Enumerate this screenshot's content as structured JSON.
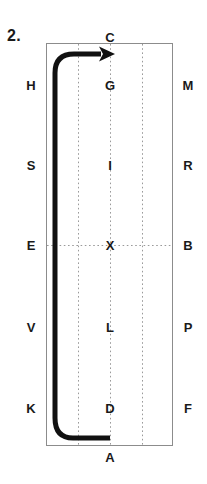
{
  "figure": {
    "index_label": "2.",
    "caption": "",
    "colors": {
      "rect_stroke": "#8c8c8c",
      "dotted": "#9a9a9a",
      "path": "#111111",
      "text": "#1a1a1a",
      "background": "#ffffff"
    },
    "rectangle": {
      "x": 46,
      "y": 43,
      "width": 126,
      "height": 402,
      "stroke_width": 1
    },
    "grid": {
      "vertical_lines_x": [
        78,
        110,
        142
      ],
      "horizontal_lines_y": [
        245
      ],
      "style": "dotted"
    },
    "labels": {
      "top": [
        {
          "text": "C",
          "x": 110,
          "y": 37
        }
      ],
      "bottom": [
        {
          "text": "A",
          "x": 110,
          "y": 457
        }
      ],
      "left": [
        {
          "text": "H",
          "x": 31,
          "y": 85
        },
        {
          "text": "S",
          "x": 31,
          "y": 165
        },
        {
          "text": "E",
          "x": 31,
          "y": 245
        },
        {
          "text": "V",
          "x": 31,
          "y": 327
        },
        {
          "text": "K",
          "x": 31,
          "y": 408
        }
      ],
      "right": [
        {
          "text": "M",
          "x": 188,
          "y": 85
        },
        {
          "text": "R",
          "x": 188,
          "y": 165
        },
        {
          "text": "B",
          "x": 188,
          "y": 245
        },
        {
          "text": "P",
          "x": 188,
          "y": 327
        },
        {
          "text": "F",
          "x": 188,
          "y": 408
        }
      ],
      "center": [
        {
          "text": "G",
          "x": 110,
          "y": 85
        },
        {
          "text": "I",
          "x": 110,
          "y": 165
        },
        {
          "text": "X",
          "x": 110,
          "y": 245
        },
        {
          "text": "L",
          "x": 110,
          "y": 327
        },
        {
          "text": "D",
          "x": 110,
          "y": 408
        }
      ]
    },
    "arrow_path": {
      "description": "thick U-shaped stroke starting at bottom center, running left, curving up the left inner side, curving right at top, ending with arrowhead at top center",
      "d": "M 110 438 L 72 438 Q 55 438 55 419 L 55 72 Q 55 54 73 54 L 100 54",
      "stroke_width": 5,
      "arrowhead": {
        "tip_x": 113,
        "tip_y": 54,
        "direction": "right"
      }
    }
  }
}
